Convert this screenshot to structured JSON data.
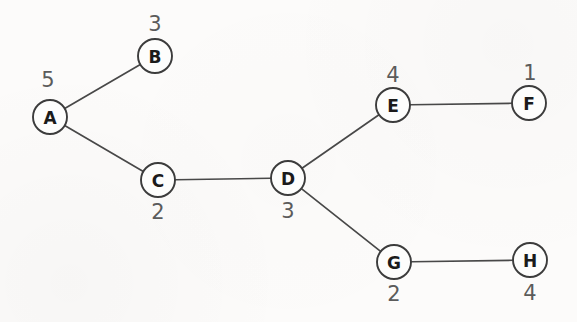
{
  "diagram": {
    "background_color": "#fcfbfa",
    "edge_color": "#484848",
    "node_stroke_color": "#3c3c3c",
    "node_fill_color": "#fdfdfc",
    "letter_color": "#1b1b1b",
    "weight_color": "#5b5b5b",
    "node_radius": 17
  },
  "nodes": [
    {
      "id": "A",
      "label": "A",
      "weight": "5",
      "cx": 50,
      "cy": 117,
      "weight_x": 48,
      "weight_y": 80,
      "weight_position": "above"
    },
    {
      "id": "B",
      "label": "B",
      "weight": "3",
      "cx": 155,
      "cy": 56,
      "weight_x": 155,
      "weight_y": 24,
      "weight_position": "above"
    },
    {
      "id": "C",
      "label": "C",
      "weight": "2",
      "cx": 158,
      "cy": 180,
      "weight_x": 158,
      "weight_y": 212,
      "weight_position": "below"
    },
    {
      "id": "D",
      "label": "D",
      "weight": "3",
      "cx": 288,
      "cy": 178,
      "weight_x": 288,
      "weight_y": 211,
      "weight_position": "below"
    },
    {
      "id": "E",
      "label": "E",
      "weight": "4",
      "cx": 393,
      "cy": 105,
      "weight_x": 393,
      "weight_y": 75,
      "weight_position": "above"
    },
    {
      "id": "F",
      "label": "F",
      "weight": "1",
      "cx": 529,
      "cy": 103,
      "weight_x": 530,
      "weight_y": 73,
      "weight_position": "above"
    },
    {
      "id": "G",
      "label": "G",
      "weight": "2",
      "cx": 394,
      "cy": 262,
      "weight_x": 394,
      "weight_y": 294,
      "weight_position": "below"
    },
    {
      "id": "H",
      "label": "H",
      "weight": "4",
      "cx": 530,
      "cy": 260,
      "weight_x": 530,
      "weight_y": 293,
      "weight_position": "below"
    }
  ],
  "edges": [
    {
      "id": "A-B",
      "from": "A",
      "to": "B"
    },
    {
      "id": "A-C",
      "from": "A",
      "to": "C"
    },
    {
      "id": "C-D",
      "from": "C",
      "to": "D"
    },
    {
      "id": "D-E",
      "from": "D",
      "to": "E"
    },
    {
      "id": "D-G",
      "from": "D",
      "to": "G"
    },
    {
      "id": "E-F",
      "from": "E",
      "to": "F"
    },
    {
      "id": "G-H",
      "from": "G",
      "to": "H"
    }
  ]
}
